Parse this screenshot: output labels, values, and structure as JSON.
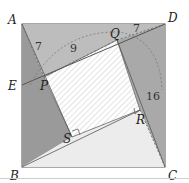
{
  "diagram": {
    "type": "geometry",
    "colors": {
      "dark_triangle": "#9a9a9a",
      "mid_triangle": "#bdbdbd",
      "light_triangle": "#ececec",
      "hatch_fill": "#ffffff",
      "hatch_line": "#c8c8c8",
      "edge": "#555555",
      "dashed": "#666666"
    },
    "points": {
      "A": {
        "label": "A",
        "x": 22,
        "y": 24
      },
      "B": {
        "label": "B",
        "x": 22,
        "y": 167
      },
      "C": {
        "label": "C",
        "x": 165,
        "y": 167
      },
      "D": {
        "label": "D",
        "x": 165,
        "y": 24
      },
      "E": {
        "label": "E",
        "x": 22,
        "y": 85
      },
      "P": {
        "label": "P",
        "x": 44,
        "y": 77
      },
      "Q": {
        "label": "Q",
        "x": 117,
        "y": 40
      },
      "R": {
        "label": "R",
        "x": 140,
        "y": 110
      },
      "S": {
        "label": "S",
        "x": 72,
        "y": 137
      }
    },
    "measurements": [
      {
        "id": "AP",
        "value": "7"
      },
      {
        "id": "PQ",
        "value": "9"
      },
      {
        "id": "QD",
        "value": "7"
      },
      {
        "id": "RC",
        "value": "16"
      }
    ]
  }
}
